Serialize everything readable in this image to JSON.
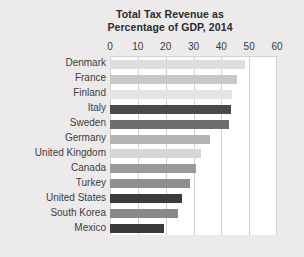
{
  "chart_data": {
    "type": "bar",
    "orientation": "horizontal",
    "title": "Total Tax Revenue as Percentage of GDP, 2014",
    "title_lines": [
      "Total Tax Revenue as",
      "Percentage of GDP, 2014"
    ],
    "xlabel": "",
    "ylabel": "",
    "xlim": [
      0,
      60
    ],
    "xticks": [
      0,
      10,
      20,
      30,
      40,
      50,
      60
    ],
    "xtick_labels": [
      "0",
      "10",
      "20",
      "30",
      "40",
      "50",
      "60"
    ],
    "grid": true,
    "grid_axis": "x",
    "legend": false,
    "categories": [
      "Denmark",
      "France",
      "Finland",
      "Italy",
      "Sweden",
      "Germany",
      "United Kingdom",
      "Canada",
      "Turkey",
      "United States",
      "South Korea",
      "Mexico"
    ],
    "values": [
      48.6,
      45.5,
      43.9,
      43.6,
      42.7,
      36.1,
      32.6,
      30.8,
      28.7,
      26.0,
      24.6,
      19.5
    ],
    "bar_colors": [
      "#dedede",
      "#c8c8c8",
      "#e4e4e4",
      "#4a4a4a",
      "#6e6e6e",
      "#b4b4b4",
      "#d6d6d6",
      "#9a9a9a",
      "#8e8e8e",
      "#3c3c3c",
      "#8a8a8a",
      "#3a3a3a"
    ]
  },
  "style": {
    "page_background": "#eceaea",
    "plot_background": "#ffffff",
    "gridline_color": "#d2d0d0",
    "title_color": "#2b2b2b",
    "tick_label_color": "#3a3a3a",
    "category_label_color": "#3d3d3d"
  }
}
